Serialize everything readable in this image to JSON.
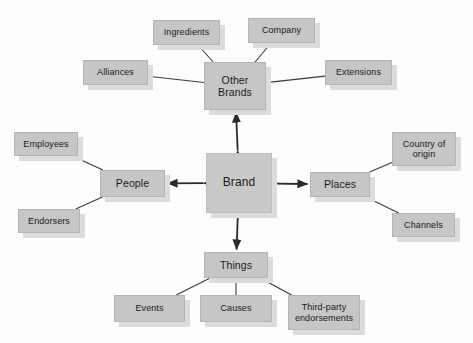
{
  "diagram": {
    "canvas": {
      "width": 473,
      "height": 343,
      "background": "#fdfdfd"
    },
    "style": {
      "node_fill": "#c6c6c6",
      "node_border": "#b4b4b4",
      "node_shadow": "#dcdcdc",
      "line_color": "#3a3a3a",
      "text_color": "#1a1a1a"
    },
    "center": {
      "id": "brand",
      "label": "Brand",
      "x": 206,
      "y": 153,
      "w": 66,
      "h": 60,
      "font": "lg"
    },
    "hubs": [
      {
        "id": "other-brands",
        "label": "Other\nBrands",
        "x": 204,
        "y": 62,
        "w": 62,
        "h": 48,
        "font": "md"
      },
      {
        "id": "people",
        "label": "People",
        "x": 100,
        "y": 170,
        "w": 65,
        "h": 27,
        "font": "md"
      },
      {
        "id": "places",
        "label": "Places",
        "x": 310,
        "y": 172,
        "w": 60,
        "h": 25,
        "font": "md"
      },
      {
        "id": "things",
        "label": "Things",
        "x": 204,
        "y": 252,
        "w": 64,
        "h": 26,
        "font": "md"
      }
    ],
    "leaves": [
      {
        "id": "ingredients",
        "label": "Ingredients",
        "hub": "other-brands",
        "x": 153,
        "y": 20,
        "w": 67,
        "h": 25,
        "font": "sm"
      },
      {
        "id": "company",
        "label": "Company",
        "hub": "other-brands",
        "x": 248,
        "y": 18,
        "w": 67,
        "h": 25,
        "font": "sm"
      },
      {
        "id": "alliances",
        "label": "Alliances",
        "hub": "other-brands",
        "x": 83,
        "y": 60,
        "w": 65,
        "h": 25,
        "font": "sm"
      },
      {
        "id": "extensions",
        "label": "Extensions",
        "hub": "other-brands",
        "x": 325,
        "y": 60,
        "w": 67,
        "h": 25,
        "font": "sm"
      },
      {
        "id": "employees",
        "label": "Employees",
        "hub": "people",
        "x": 14,
        "y": 132,
        "w": 64,
        "h": 24,
        "font": "sm"
      },
      {
        "id": "endorsers",
        "label": "Endorsers",
        "hub": "people",
        "x": 18,
        "y": 209,
        "w": 62,
        "h": 24,
        "font": "sm"
      },
      {
        "id": "country-of-origin",
        "label": "Country of\norigin",
        "hub": "places",
        "x": 392,
        "y": 132,
        "w": 64,
        "h": 34,
        "font": "sm"
      },
      {
        "id": "channels",
        "label": "Channels",
        "hub": "places",
        "x": 392,
        "y": 213,
        "w": 63,
        "h": 24,
        "font": "sm"
      },
      {
        "id": "events",
        "label": "Events",
        "hub": "things",
        "x": 114,
        "y": 295,
        "w": 71,
        "h": 27,
        "font": "sm"
      },
      {
        "id": "causes",
        "label": "Causes",
        "hub": "things",
        "x": 200,
        "y": 295,
        "w": 72,
        "h": 27,
        "font": "sm"
      },
      {
        "id": "third-party-endorsements",
        "label": "Third-party\nendorsements",
        "hub": "things",
        "x": 288,
        "y": 295,
        "w": 72,
        "h": 35,
        "font": "sm"
      }
    ],
    "arrows": [
      {
        "id": "brand-other-brands",
        "from": "brand",
        "to": "other-brands",
        "double": true
      },
      {
        "id": "brand-people",
        "from": "brand",
        "to": "people",
        "double": true
      },
      {
        "id": "brand-places",
        "from": "brand",
        "to": "places",
        "double": true
      },
      {
        "id": "brand-things",
        "from": "brand",
        "to": "things",
        "double": true
      }
    ],
    "connectors": [
      {
        "id": "ingredients-other-brands",
        "from": "ingredients",
        "to": "other-brands"
      },
      {
        "id": "company-other-brands",
        "from": "company",
        "to": "other-brands"
      },
      {
        "id": "alliances-other-brands",
        "from": "alliances",
        "to": "other-brands"
      },
      {
        "id": "extensions-other-brands",
        "from": "extensions",
        "to": "other-brands"
      },
      {
        "id": "employees-people",
        "from": "employees",
        "to": "people"
      },
      {
        "id": "endorsers-people",
        "from": "endorsers",
        "to": "people"
      },
      {
        "id": "country-of-origin-places",
        "from": "country-of-origin",
        "to": "places"
      },
      {
        "id": "channels-places",
        "from": "channels",
        "to": "places"
      },
      {
        "id": "events-things",
        "from": "events",
        "to": "things"
      },
      {
        "id": "causes-things",
        "from": "causes",
        "to": "things"
      },
      {
        "id": "third-party-endorsements-things",
        "from": "third-party-endorsements",
        "to": "things"
      }
    ]
  }
}
